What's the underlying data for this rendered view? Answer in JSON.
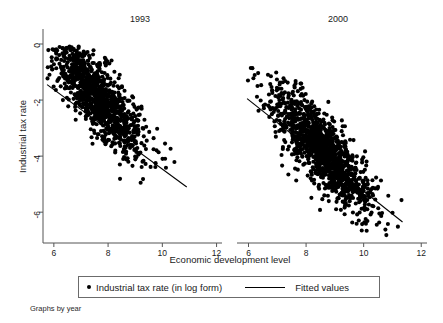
{
  "chart_data": {
    "type": "scatter",
    "title": "",
    "xlabel": "Economic development level",
    "ylabel": "Industrial tax rate",
    "footer": "Graphs by year",
    "grid": false,
    "legend_position": "bottom",
    "xlim": [
      5.6,
      12.2
    ],
    "ylim": [
      -7.1,
      0.5
    ],
    "xticks": [
      6,
      8,
      10,
      12
    ],
    "xtick_labels": [
      "6",
      "8",
      "10",
      "12"
    ],
    "yticks": [
      0,
      -2,
      -4,
      -6
    ],
    "ytick_labels": [
      "0",
      "-2",
      "-4",
      "-6"
    ],
    "legend": [
      {
        "marker": "dot",
        "label": "Industrial tax rate (in log form)"
      },
      {
        "marker": "line",
        "label": "Fitted values"
      }
    ],
    "panels": [
      {
        "name": "1993",
        "title": "1993",
        "n_points": 1100,
        "fit_line": {
          "x0": 5.75,
          "y0": -1.45,
          "x1": 10.9,
          "y1": -5.1
        },
        "cloud": {
          "x_mean": 7.65,
          "x_sd": 0.82,
          "x_min": 5.75,
          "x_max": 10.95,
          "intercept": 5.55,
          "slope": -0.97,
          "resid_sd": 0.62,
          "y_min": -5.25,
          "y_max": -0.05
        }
      },
      {
        "name": "2000",
        "title": "2000",
        "n_points": 1250,
        "fit_line": {
          "x0": 5.95,
          "y0": -1.95,
          "x1": 11.35,
          "y1": -6.35
        },
        "cloud": {
          "x_mean": 8.55,
          "x_sd": 0.88,
          "x_min": 5.9,
          "x_max": 11.45,
          "intercept": 5.0,
          "slope": -1.02,
          "resid_sd": 0.66,
          "y_min": -6.9,
          "y_max": -0.75
        }
      }
    ]
  },
  "colors": {
    "marker": "#000000",
    "line": "#000000",
    "axis": "#555555",
    "text": "#1a1a1a",
    "legend_border": "#6b6b6b",
    "background": "#ffffff"
  },
  "axes": {
    "left_panel": {
      "x_title": "",
      "tick_labels_x": [
        "6",
        "8",
        "10",
        "12"
      ]
    },
    "right_panel": {
      "x_title": "",
      "tick_labels_x": [
        "6",
        "8",
        "10",
        "12"
      ]
    }
  }
}
